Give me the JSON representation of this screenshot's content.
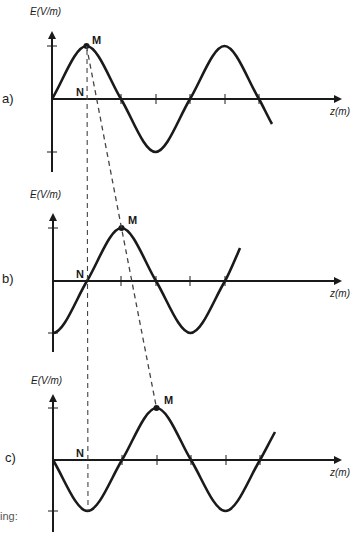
{
  "diagram": {
    "y_axis_label": "E(V/m)",
    "x_axis_label": "z(m)",
    "point_max_label": "M",
    "point_node_label": "N",
    "footer_fragment": "ing:",
    "panels": [
      {
        "id": "a",
        "label": "a)",
        "phase": "starts at zero going up; M at first crest, N below M on axis"
      },
      {
        "id": "b",
        "label": "b)",
        "phase": "starts at trough; N at first zero crossing, M at next crest"
      },
      {
        "id": "c",
        "label": "c)",
        "phase": "starts at zero going down; N below first trough, M at next crest"
      }
    ],
    "colors": {
      "curve": "#1a1a1a",
      "dashed": "#444444",
      "background": "#ffffff"
    }
  }
}
